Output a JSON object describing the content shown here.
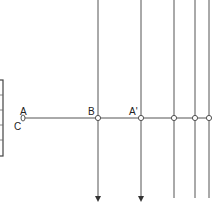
{
  "diagram": {
    "colors": {
      "line": "#555555",
      "text": "#222222",
      "background": "#ffffff"
    },
    "labels": {
      "A": "A",
      "C": "C",
      "B": "B",
      "A_prime": "A'"
    },
    "horizontal_line": {
      "y": 118,
      "x_start": 24,
      "x_end": 210
    },
    "nodes": [
      {
        "id": "A",
        "x": 23,
        "y": 118
      },
      {
        "id": "B",
        "x": 98,
        "y": 118
      },
      {
        "id": "A_prime",
        "x": 141,
        "y": 118
      },
      {
        "id": "n4",
        "x": 174,
        "y": 118
      },
      {
        "id": "n5",
        "x": 195,
        "y": 118
      },
      {
        "id": "n6",
        "x": 209,
        "y": 118
      }
    ],
    "vertical_lines": [
      {
        "x": 98,
        "arrow": true
      },
      {
        "x": 141,
        "arrow": true
      },
      {
        "x": 174,
        "arrow": false
      },
      {
        "x": 195,
        "arrow": false
      },
      {
        "x": 209,
        "arrow": false
      }
    ],
    "left_bar": {
      "divisions": 5
    }
  }
}
